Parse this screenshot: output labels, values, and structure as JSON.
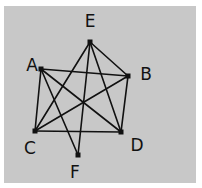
{
  "diagram": {
    "type": "graph",
    "background_color": "#c8c8c8",
    "edge_color": "#111111",
    "nodes": [
      {
        "id": "A",
        "label": "A",
        "x": 41,
        "y": 69,
        "lx": 32,
        "ly": 65
      },
      {
        "id": "B",
        "label": "B",
        "x": 128,
        "y": 76,
        "lx": 146,
        "ly": 74
      },
      {
        "id": "C",
        "label": "C",
        "x": 35,
        "y": 131,
        "lx": 30,
        "ly": 148
      },
      {
        "id": "D",
        "label": "D",
        "x": 121,
        "y": 132,
        "lx": 137,
        "ly": 145
      },
      {
        "id": "E",
        "label": "E",
        "x": 90,
        "y": 42,
        "lx": 90,
        "ly": 21
      },
      {
        "id": "F",
        "label": "F",
        "x": 78,
        "y": 155,
        "lx": 75,
        "ly": 172
      }
    ],
    "edges": [
      [
        "E",
        "B"
      ],
      [
        "E",
        "C"
      ],
      [
        "E",
        "D"
      ],
      [
        "E",
        "F"
      ],
      [
        "A",
        "B"
      ],
      [
        "A",
        "C"
      ],
      [
        "A",
        "D"
      ],
      [
        "A",
        "F"
      ],
      [
        "B",
        "C"
      ],
      [
        "B",
        "D"
      ],
      [
        "C",
        "D"
      ]
    ]
  }
}
